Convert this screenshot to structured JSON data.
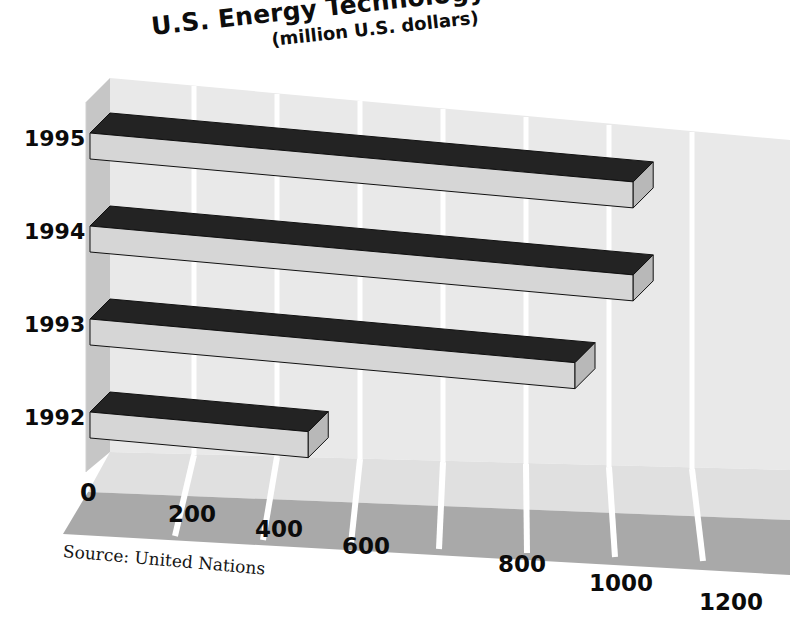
{
  "chart_data": {
    "type": "bar",
    "orientation": "horizontal",
    "title": "U.S. Energy Technology Exports to ASEAN",
    "subtitle": "(million U.S. dollars)",
    "xlabel": "",
    "ylabel": "",
    "categories": [
      "1992",
      "1993",
      "1994",
      "1995"
    ],
    "values": [
      450,
      1000,
      1120,
      1120
    ],
    "xlim": [
      0,
      1200
    ],
    "xticks": [
      "0",
      "200",
      "400",
      "600",
      "800",
      "1000",
      "1200"
    ],
    "xtick_values": [
      0,
      200,
      400,
      600,
      800,
      1000,
      1200
    ],
    "grid": true,
    "legend": "none",
    "annotations": [
      "Source: United Nations"
    ],
    "style": "3d-perspective-bars",
    "series": [
      {
        "name": "U.S. Energy Technology Exports to ASEAN",
        "values": [
          450,
          1000,
          1120,
          1120
        ]
      }
    ]
  },
  "title": {
    "main": "U.S. Energy Technology Exports to ASEAN",
    "sub": "(million U.S. dollars)"
  },
  "axis": {
    "years": [
      "1995",
      "1994",
      "1993",
      "1992"
    ],
    "ticks": [
      "0",
      "200",
      "400",
      "600",
      "800",
      "1000",
      "1200"
    ]
  },
  "source": {
    "note": "Source: United Nations"
  },
  "colors": {
    "bar_top": "#232323",
    "bar_front": "#d6d6d6",
    "bar_side": "#b8b8b8",
    "back_wall": "#e8e8e8",
    "side_wall": "#c9c9c9",
    "floor_light": "#e3e3e3",
    "floor_dark": "#a8a8a8",
    "gridline": "#ffffff",
    "text": "#0b0b0b",
    "background": "#ffffff"
  }
}
